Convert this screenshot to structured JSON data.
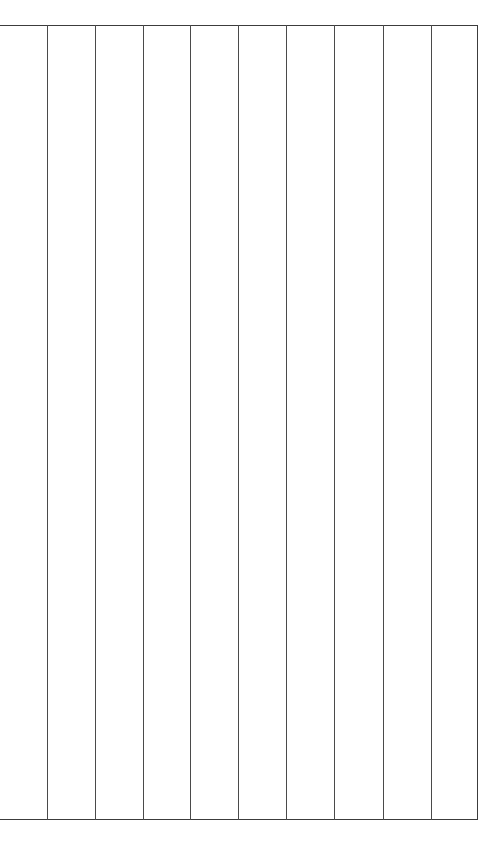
{
  "document": {
    "type": "table-grid",
    "title": "",
    "background_color": "#ffffff",
    "line_color": "#3c3c3c",
    "column_count": 10,
    "row_count": 1,
    "has_left_border": false,
    "has_right_border": true,
    "has_top_border": true,
    "has_bottom_border": true
  },
  "grid": {
    "top_rule_y": 26,
    "bottom_rule_y": 820,
    "left_x": 0,
    "right_x": 477,
    "vertical_line_positions": [
      47,
      95,
      143,
      190,
      238,
      286,
      334,
      383,
      431,
      477
    ]
  },
  "columns": [
    {
      "index": 0,
      "header": "",
      "cells": [
        ""
      ]
    },
    {
      "index": 1,
      "header": "",
      "cells": [
        ""
      ]
    },
    {
      "index": 2,
      "header": "",
      "cells": [
        ""
      ]
    },
    {
      "index": 3,
      "header": "",
      "cells": [
        ""
      ]
    },
    {
      "index": 4,
      "header": "",
      "cells": [
        ""
      ]
    },
    {
      "index": 5,
      "header": "",
      "cells": [
        ""
      ]
    },
    {
      "index": 6,
      "header": "",
      "cells": [
        ""
      ]
    },
    {
      "index": 7,
      "header": "",
      "cells": [
        ""
      ]
    },
    {
      "index": 8,
      "header": "",
      "cells": [
        ""
      ]
    },
    {
      "index": 9,
      "header": "",
      "cells": [
        ""
      ]
    }
  ]
}
